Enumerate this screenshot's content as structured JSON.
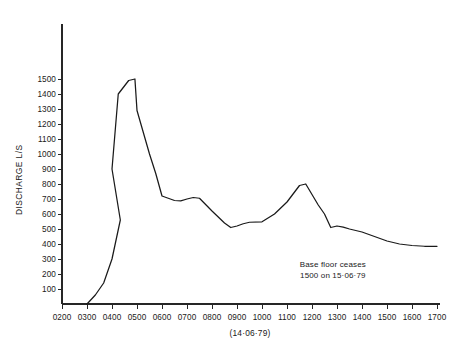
{
  "chart_data": {
    "type": "line",
    "title": "",
    "xlabel": "(14·06·79)",
    "ylabel": "DISCHARGE L/S",
    "xlim": [
      200,
      1700
    ],
    "ylim": [
      0,
      1550
    ],
    "grid": false,
    "legend": null,
    "x_tick_labels": [
      "0200",
      "0300",
      "0400",
      "0500",
      "0600",
      "0700",
      "0800",
      "0900",
      "1000",
      "1100",
      "1200",
      "1300",
      "1400",
      "1500",
      "1600",
      "1700"
    ],
    "x_tick_values": [
      200,
      300,
      400,
      500,
      600,
      700,
      800,
      900,
      1000,
      1100,
      1200,
      1300,
      1400,
      1500,
      1600,
      1700
    ],
    "y_tick_labels": [
      "100",
      "200",
      "300",
      "400",
      "500",
      "600",
      "700",
      "800",
      "900",
      "1000",
      "1100",
      "1200",
      "1300",
      "1400",
      "1500"
    ],
    "y_tick_values": [
      100,
      200,
      300,
      400,
      500,
      600,
      700,
      800,
      900,
      1000,
      1100,
      1200,
      1300,
      1400,
      1500
    ],
    "series": [
      {
        "name": "Discharge hydrograph",
        "x": [
          300,
          320,
          340,
          360,
          380,
          400,
          415,
          440,
          455,
          500,
          530,
          545,
          600,
          630,
          645,
          700,
          715,
          730,
          800,
          830,
          845,
          900,
          915,
          930,
          1000,
          1030,
          1100,
          1130,
          1145,
          1200,
          1215,
          1230,
          1245,
          1300,
          1315,
          1330,
          1400,
          1430,
          1500,
          1530,
          1600,
          1630,
          1700
        ],
        "y": [
          0,
          60,
          140,
          300,
          560,
          900,
          1400,
          1490,
          1500,
          1290,
          1000,
          870,
          720,
          690,
          688,
          700,
          710,
          705,
          620,
          540,
          510,
          520,
          535,
          545,
          548,
          600,
          680,
          790,
          800,
          730,
          660,
          600,
          510,
          520,
          512,
          500,
          480,
          450,
          420,
          400,
          390,
          385,
          385
        ],
        "units": "L/S"
      }
    ],
    "annotations": [
      {
        "name": "base-flow-note",
        "lines": [
          "Base floor ceases",
          "1500 on 15·06·79"
        ],
        "x": 1250,
        "y": 250
      }
    ]
  },
  "axes": {
    "y_axis_name": "discharge-axis",
    "x_axis_name": "time-axis"
  }
}
